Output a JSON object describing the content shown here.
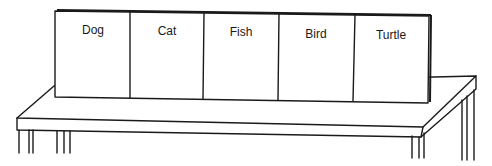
{
  "illustration": {
    "description": "A sign board with five labeled panels standing on a table",
    "panels": [
      {
        "label": "Dog"
      },
      {
        "label": "Cat"
      },
      {
        "label": "Fish"
      },
      {
        "label": "Bird"
      },
      {
        "label": "Turtle"
      }
    ],
    "colors": {
      "line": "#1a1a1a",
      "background": "#ffffff"
    }
  }
}
